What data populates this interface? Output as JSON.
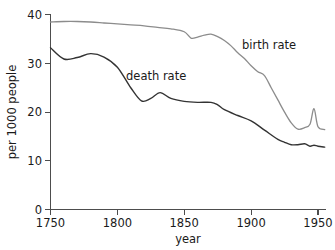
{
  "chart_data": {
    "type": "line",
    "title": "",
    "xlabel": "year",
    "ylabel": "per 1000 people",
    "xlim": [
      1750,
      1955
    ],
    "ylim": [
      0,
      40
    ],
    "xticks": [
      1750,
      1800,
      1850,
      1900,
      1950
    ],
    "xtick_labels": [
      "1750",
      "1800",
      "1850",
      "1900",
      "1950"
    ],
    "yticks": [
      0,
      10,
      20,
      30,
      40
    ],
    "ytick_labels": [
      "0",
      "10",
      "20",
      "30",
      "40"
    ],
    "grid": false,
    "legend_position": "inline-annotation",
    "series": [
      {
        "name": "birth rate",
        "color": "#8c8c8c",
        "label_text": "birth rate",
        "x": [
          1750,
          1760,
          1770,
          1780,
          1790,
          1800,
          1810,
          1820,
          1830,
          1840,
          1850,
          1855,
          1860,
          1865,
          1870,
          1875,
          1880,
          1885,
          1890,
          1895,
          1900,
          1905,
          1910,
          1915,
          1920,
          1925,
          1930,
          1935,
          1940,
          1944,
          1947,
          1950,
          1955
        ],
        "values": [
          38.5,
          38.6,
          38.6,
          38.5,
          38.3,
          38.1,
          37.9,
          37.7,
          37.4,
          37.1,
          36.5,
          35.2,
          35.4,
          35.8,
          36.0,
          35.5,
          34.7,
          33.6,
          32.2,
          31.0,
          29.5,
          28.3,
          27.5,
          25.0,
          22.5,
          20.0,
          17.8,
          16.5,
          16.8,
          17.5,
          20.7,
          17.0,
          16.4
        ]
      },
      {
        "name": "death rate",
        "color": "#333333",
        "label_text": "death rate",
        "x": [
          1750,
          1760,
          1770,
          1780,
          1790,
          1800,
          1810,
          1818,
          1825,
          1832,
          1840,
          1850,
          1860,
          1870,
          1875,
          1880,
          1890,
          1900,
          1910,
          1920,
          1925,
          1930,
          1935,
          1940,
          1944,
          1947,
          1950,
          1955
        ],
        "values": [
          33.2,
          30.9,
          31.2,
          32.0,
          31.3,
          29.2,
          25.0,
          22.3,
          22.8,
          24.0,
          22.8,
          22.2,
          22.0,
          22.0,
          21.5,
          20.5,
          19.3,
          18.2,
          16.3,
          14.4,
          13.8,
          13.3,
          13.3,
          13.5,
          13.0,
          13.2,
          13.0,
          12.8
        ]
      }
    ],
    "annotations": [
      {
        "text": "birth rate",
        "x": 1905,
        "y": 31.5
      },
      {
        "text": "death rate",
        "x": 1823,
        "y": 27.0
      }
    ]
  },
  "colors": {
    "background": "#ffffff",
    "axis": "#4d4d4d",
    "text": "#1a1a1a",
    "birth_rate": "#8c8c8c",
    "death_rate": "#333333"
  }
}
